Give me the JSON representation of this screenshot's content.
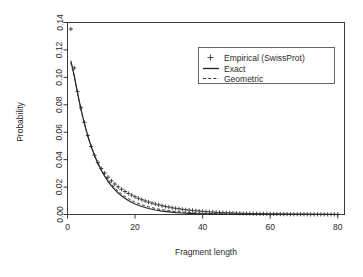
{
  "chart_data": {
    "type": "line",
    "title": "",
    "xlabel": "Fragment length",
    "ylabel": "Probability",
    "xlim": [
      0,
      82
    ],
    "ylim": [
      0.0,
      0.14
    ],
    "xticks": [
      0,
      20,
      40,
      60,
      80
    ],
    "xtick_labels": [
      "0",
      "20",
      "40",
      "60",
      "80"
    ],
    "yticks": [
      0.0,
      0.02,
      0.04,
      0.06,
      0.08,
      0.1,
      0.12,
      0.14
    ],
    "ytick_labels": [
      "0.00",
      "0.02",
      "0.04",
      "0.06",
      "0.08",
      "0.10",
      "0.12",
      "0.14"
    ],
    "grid": false,
    "legend_position": "top-right",
    "legend": [
      {
        "label": "Empirical (SwissProt)",
        "marker": "plus",
        "style": "points"
      },
      {
        "label": "Exact",
        "marker": "line",
        "style": "solid"
      },
      {
        "label": "Geometric",
        "marker": "line",
        "style": "dashed"
      }
    ],
    "series": [
      {
        "name": "Empirical (SwissProt)",
        "style": "points",
        "x": [
          1,
          2,
          3,
          4,
          5,
          6,
          7,
          8,
          9,
          10,
          11,
          12,
          13,
          14,
          15,
          16,
          17,
          18,
          19,
          20,
          21,
          22,
          23,
          24,
          25,
          26,
          27,
          28,
          29,
          30,
          31,
          32,
          33,
          34,
          35,
          36,
          37,
          38,
          39,
          40,
          41,
          42,
          43,
          44,
          45,
          46,
          47,
          48,
          49,
          50,
          51,
          52,
          53,
          54,
          55,
          56,
          57,
          58,
          59,
          60,
          61,
          62,
          63,
          64,
          65,
          66,
          67,
          68,
          69,
          70,
          71,
          72,
          73,
          74,
          75,
          76,
          77,
          78,
          79,
          80
        ],
        "y": [
          0.1352,
          0.1068,
          0.0896,
          0.0778,
          0.0672,
          0.0576,
          0.0496,
          0.0432,
          0.0378,
          0.0336,
          0.0302,
          0.0272,
          0.0246,
          0.0222,
          0.0202,
          0.0184,
          0.0168,
          0.0154,
          0.0141,
          0.0129,
          0.0118,
          0.0108,
          0.0099,
          0.0091,
          0.0083,
          0.0076,
          0.007,
          0.0064,
          0.0059,
          0.0054,
          0.0049,
          0.0045,
          0.0042,
          0.0038,
          0.0035,
          0.0032,
          0.003,
          0.0027,
          0.0025,
          0.0023,
          0.0021,
          0.0019,
          0.0018,
          0.0016,
          0.0015,
          0.0014,
          0.0013,
          0.0012,
          0.0011,
          0.001,
          0.0009,
          0.0008,
          0.0008,
          0.0007,
          0.0006,
          0.0006,
          0.0005,
          0.0005,
          0.0005,
          0.0004,
          0.0004,
          0.0004,
          0.0003,
          0.0003,
          0.0003,
          0.0002,
          0.0002,
          0.0002,
          0.0002,
          0.0002,
          0.0002,
          0.0001,
          0.0001,
          0.0001,
          0.0001,
          0.0001,
          0.0001,
          0.0001,
          0.0001,
          0.0001
        ]
      },
      {
        "name": "Exact",
        "style": "solid",
        "x": [
          1,
          2,
          3,
          4,
          5,
          6,
          7,
          8,
          9,
          10,
          11,
          12,
          13,
          14,
          15,
          16,
          17,
          18,
          19,
          20,
          22,
          24,
          26,
          28,
          30,
          32,
          34,
          36,
          38,
          40,
          44,
          48,
          52,
          56,
          60,
          65,
          70,
          75,
          80
        ],
        "y": [
          0.112,
          0.1012,
          0.0884,
          0.0766,
          0.0664,
          0.0574,
          0.0496,
          0.043,
          0.0372,
          0.0322,
          0.0279,
          0.0242,
          0.0209,
          0.0181,
          0.0157,
          0.0136,
          0.0118,
          0.0102,
          0.0089,
          0.0077,
          0.0058,
          0.0044,
          0.0033,
          0.0025,
          0.0019,
          0.0014,
          0.0011,
          0.0008,
          0.0006,
          0.0005,
          0.0003,
          0.0002,
          0.0001,
          0.0001,
          0.0001,
          5e-05,
          3e-05,
          2e-05,
          1e-05
        ]
      },
      {
        "name": "Geometric",
        "style": "dashed",
        "x": [
          1,
          2,
          3,
          4,
          5,
          6,
          7,
          8,
          9,
          10,
          11,
          12,
          13,
          14,
          15,
          16,
          17,
          18,
          19,
          20,
          22,
          24,
          26,
          28,
          30,
          32,
          34,
          36,
          38,
          40,
          44,
          48,
          52,
          56,
          60,
          65,
          70,
          75,
          80
        ],
        "y": [
          0.1105,
          0.1,
          0.0878,
          0.0762,
          0.0662,
          0.0574,
          0.0498,
          0.0434,
          0.0378,
          0.033,
          0.0288,
          0.0252,
          0.0221,
          0.0194,
          0.017,
          0.015,
          0.0132,
          0.0116,
          0.0103,
          0.0091,
          0.0071,
          0.0056,
          0.0044,
          0.0035,
          0.0028,
          0.0022,
          0.0018,
          0.0014,
          0.0011,
          0.0009,
          0.0006,
          0.0004,
          0.0003,
          0.0002,
          0.0001,
          0.0001,
          6e-05,
          4e-05,
          2e-05
        ]
      }
    ]
  },
  "colors": {
    "axis": "#3a3a3a",
    "exact": "#222222",
    "geometric": "#333333",
    "empirical": "#2b2b2b",
    "background": "#ffffff"
  }
}
